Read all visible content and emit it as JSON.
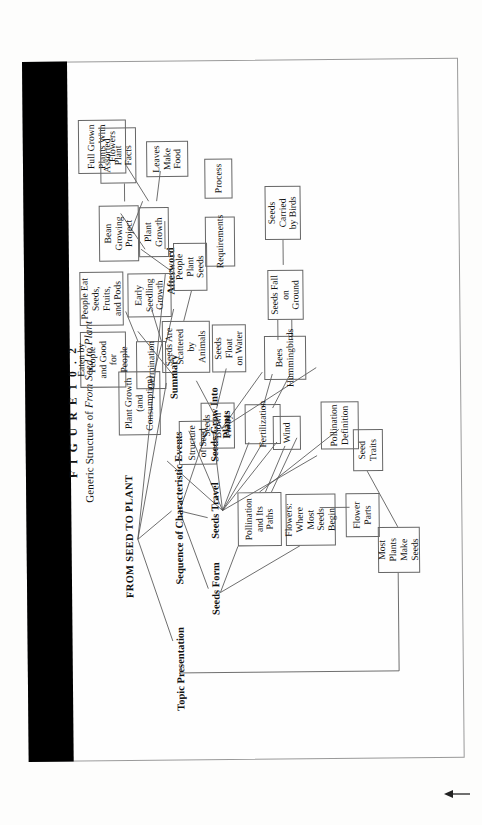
{
  "figure": {
    "label": "F I G U R E   1 0 . 2",
    "subtitle_prefix": "Generic Structure of ",
    "subtitle_italic": "From Seed to Plant"
  },
  "colors": {
    "page": "#fefefe",
    "gutter": "#000000",
    "line": "#555555",
    "box_border": "#666666",
    "text": "#111111"
  },
  "diagram": {
    "type": "hierarchy-tree",
    "root": "FROM SEED TO PLANT",
    "level2": [
      "Topic Presentation",
      "Sequence of Characteristic Events",
      "Summary",
      "Afterword"
    ],
    "level3": [
      "Seeds Form",
      "Seeds Travel",
      "Seeds Grow Into\nPlants"
    ],
    "boxes": [
      "Most Plants\nMake Seeds",
      "Seed Traits",
      "Flowers:\nWhere Most\nSeeds Begin",
      "Flower Parts",
      "Pollination\nand Its Paths",
      "Pollination\nDefinition",
      "Wind",
      "Bees\nHummingbirds",
      "Fertilization",
      "Seeds Blown\nAway",
      "Seeds Fall on\nGround",
      "Seeds Float\non Water",
      "Seeds Carried\nby Birds",
      "Seeds Are\nScattered by\nAnimals",
      "People Plant\nSeeds",
      "Structure\nof Seed",
      "Germination",
      "Early\nSeedling\nGrowth",
      "Plant Growth\n(and Consumption)",
      "People Eat\nSeeds, Fruits,\nand Pods",
      "Plant Growth",
      "Requirements",
      "Process",
      "Leaves\nMake\nFood",
      "Full Grown\nPlants With\nFlowers",
      "Eaten by People\nand Good for\nPeople",
      "Bean Growing\nProject",
      "Assorted Plant\nFacts"
    ]
  },
  "nodes": {
    "root": "FROM SEED TO PLANT",
    "topic": "Topic Presentation",
    "sequence": "Sequence of Characteristic Events",
    "summary": "Summary",
    "afterword": "Afterword",
    "seeds_form": "Seeds Form",
    "seeds_travel": "Seeds Travel",
    "seeds_grow": "Seeds Grow Into\nPlants",
    "most_plants": "Most Plants\nMake Seeds",
    "seed_traits": "Seed Traits",
    "flowers": "Flowers:\nWhere Most\nSeeds Begin",
    "flower_parts": "Flower Parts",
    "pollination": "Pollination\nand Its Paths",
    "poll_def": "Pollination\nDefinition",
    "wind": "Wind",
    "bees": "Bees\nHummingbirds",
    "fertilization": "Fertilization",
    "blown_away": "Seeds Blown\nAway",
    "fall_ground": "Seeds Fall on\nGround",
    "float_water": "Seeds Float\non Water",
    "carried_birds": "Seeds Carried\nby Birds",
    "scattered": "Seeds Are\nScattered by\nAnimals",
    "people_plant": "People Plant\nSeeds",
    "structure_seed": "Structure\nof Seed",
    "germination": "Germination",
    "early_seedling": "Early\nSeedling\nGrowth",
    "plant_growth_c": "Plant Growth\n(and Consumption)",
    "people_eat": "People Eat\nSeeds, Fruits,\nand Pods",
    "plant_growth": "Plant Growth",
    "requirements": "Requirements",
    "process": "Process",
    "leaves": "Leaves\nMake\nFood",
    "full_grown": "Full Grown\nPlants With\nFlowers",
    "eaten_people": "Eaten by People\nand Good for\nPeople",
    "bean_project": "Bean Growing\nProject",
    "assorted": "Assorted Plant\nFacts"
  }
}
